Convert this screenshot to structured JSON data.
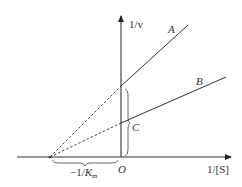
{
  "diagram": {
    "type": "lineweaver-burk-plot",
    "axes": {
      "y_label": "1/v",
      "x_label": "1/[S]",
      "origin_label": "O"
    },
    "lines": [
      {
        "name": "A",
        "label": "A",
        "style": "solid",
        "extrapolation": "dashed"
      },
      {
        "name": "B",
        "label": "B",
        "style": "solid",
        "extrapolation": "dashed"
      }
    ],
    "point_label": "C",
    "x_intercept_label": {
      "prefix": "−1/",
      "var": "K",
      "sub": "m"
    },
    "colors": {
      "ink": "#333333",
      "background": "#ffffff"
    }
  }
}
